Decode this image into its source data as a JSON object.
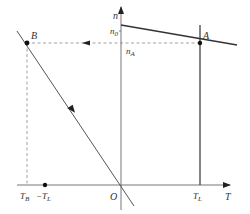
{
  "diagram": {
    "axes": {
      "y_label": "n",
      "x_label": "T",
      "origin_label": "O"
    },
    "points": {
      "A": {
        "label": "A"
      },
      "B": {
        "label": "B"
      }
    },
    "y_ticks": {
      "n0": {
        "main": "n",
        "sub": "0"
      },
      "nA": {
        "main": "n",
        "sub": "A"
      }
    },
    "x_ticks": {
      "TB": {
        "main": "T",
        "sub": "B"
      },
      "negTL": {
        "prefix": "−",
        "main": "T",
        "sub": "L"
      },
      "TL": {
        "main": "T",
        "sub": "L"
      }
    },
    "colors": {
      "line": "#333333",
      "axis": "#555555",
      "dashed": "#888888"
    }
  }
}
